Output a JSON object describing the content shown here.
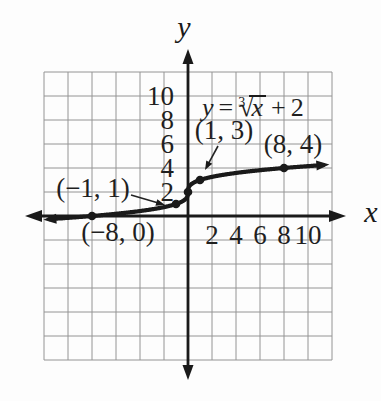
{
  "figure": {
    "background": "#fdfdfd",
    "ink_color": "#1a1a1a",
    "grid_color": "#949494",
    "text_color": "#1f1f1f"
  },
  "axes": {
    "x_label": "x",
    "y_label": "y"
  },
  "equation": {
    "lhs": "y",
    "equals": "=",
    "root_index": "3",
    "radical_sign": "√",
    "radicand": "x",
    "plus": "+",
    "constant": "2"
  },
  "chart_data": {
    "type": "line",
    "function": "y = cbrt(x) + 2",
    "xlim": [
      -12,
      12
    ],
    "ylim": [
      -12,
      12
    ],
    "grid": true,
    "grid_step": 2,
    "units_per_cell": 2,
    "x_tick_values": [
      2,
      4,
      6,
      8,
      10
    ],
    "x_tick_labels": [
      "2",
      "4",
      "6",
      "8",
      "10"
    ],
    "y_tick_values": [
      10,
      8,
      6,
      4,
      2
    ],
    "y_tick_labels": [
      "10",
      "8",
      "6",
      "4",
      "2"
    ],
    "curve_x_range": [
      -11.55,
      11.3
    ],
    "marked_points": [
      {
        "x": -8,
        "y": 0
      },
      {
        "x": -1,
        "y": 1
      },
      {
        "x": 0,
        "y": 2
      },
      {
        "x": 1,
        "y": 3
      },
      {
        "x": 8,
        "y": 4
      }
    ],
    "labeled_points": [
      {
        "label": "(−8, 0)",
        "x": -8,
        "y": 0
      },
      {
        "label": "(−1, 1)",
        "x": -1,
        "y": 1
      },
      {
        "label": "(1, 3)",
        "x": 1,
        "y": 3
      },
      {
        "label": "(8, 4)",
        "x": 8,
        "y": 4
      }
    ]
  }
}
